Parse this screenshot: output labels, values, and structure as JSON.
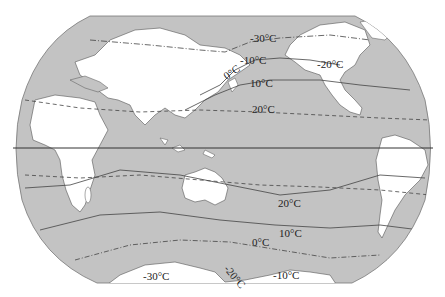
{
  "map": {
    "type": "world isotherm map",
    "projection": "Robinson-like",
    "colors": {
      "ocean": "#c3c3c3",
      "land": "#ffffff",
      "isotherm": "#444444",
      "border": "#777777"
    },
    "equator_label": "",
    "isotherm_labels": {
      "n_minus30": "-30°C",
      "n_minus10": "-10°C",
      "n_zero": "0°C",
      "n_10": "10°C",
      "n_20_pacific": "20°C",
      "n_minus20_america": "-20°C",
      "s_20": "20°C",
      "s_10": "10°C",
      "s_zero": "0°C",
      "s_minus30": "-30°C",
      "s_minus20": "-20°C",
      "s_minus10": "-10°C"
    }
  }
}
